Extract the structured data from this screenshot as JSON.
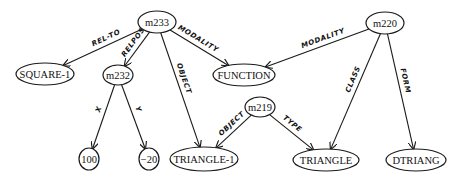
{
  "diagram": {
    "type": "semantic-network",
    "nodes": [
      {
        "id": "m233",
        "label": "m233",
        "x": 157,
        "y": 22,
        "rx": 19,
        "ry": 11
      },
      {
        "id": "m220",
        "label": "m220",
        "x": 385,
        "y": 23,
        "rx": 19,
        "ry": 11
      },
      {
        "id": "SQUARE-1",
        "label": "SQUARE-1",
        "x": 45,
        "y": 74,
        "rx": 29,
        "ry": 11
      },
      {
        "id": "m232",
        "label": "m232",
        "x": 118,
        "y": 75,
        "rx": 15,
        "ry": 10
      },
      {
        "id": "FUNCTION",
        "label": "FUNCTION",
        "x": 244,
        "y": 75,
        "rx": 31,
        "ry": 11
      },
      {
        "id": "m219",
        "label": "m219",
        "x": 260,
        "y": 107,
        "rx": 15,
        "ry": 10
      },
      {
        "id": "100",
        "label": "100",
        "x": 89,
        "y": 159,
        "rx": 10,
        "ry": 11
      },
      {
        "id": "-20",
        "label": "−20",
        "x": 149,
        "y": 159,
        "rx": 10,
        "ry": 11
      },
      {
        "id": "TRIANGLE-1",
        "label": "TRIANGLE-1",
        "x": 204,
        "y": 159,
        "rx": 34,
        "ry": 12
      },
      {
        "id": "TRIANGLE",
        "label": "TRIANGLE",
        "x": 326,
        "y": 160,
        "rx": 33,
        "ry": 11
      },
      {
        "id": "DTRIANG",
        "label": "DTRIANG",
        "x": 416,
        "y": 160,
        "rx": 30,
        "ry": 11
      }
    ],
    "edges": [
      {
        "from": "m233",
        "to": "SQUARE-1",
        "label": "REL-TO"
      },
      {
        "from": "m233",
        "to": "m232",
        "label": "RELPOS"
      },
      {
        "from": "m233",
        "to": "TRIANGLE-1",
        "label": "OBJECT"
      },
      {
        "from": "m233",
        "to": "FUNCTION",
        "label": "MODALITY"
      },
      {
        "from": "m232",
        "to": "100",
        "label": "X"
      },
      {
        "from": "m232",
        "to": "-20",
        "label": "Y"
      },
      {
        "from": "m220",
        "to": "FUNCTION",
        "label": "MODALITY"
      },
      {
        "from": "m220",
        "to": "TRIANGLE",
        "label": "CLASS"
      },
      {
        "from": "m220",
        "to": "DTRIANG",
        "label": "FORM"
      },
      {
        "from": "m219",
        "to": "TRIANGLE-1",
        "label": "OBJECT"
      },
      {
        "from": "m219",
        "to": "TRIANGLE",
        "label": "TYPE"
      }
    ]
  }
}
